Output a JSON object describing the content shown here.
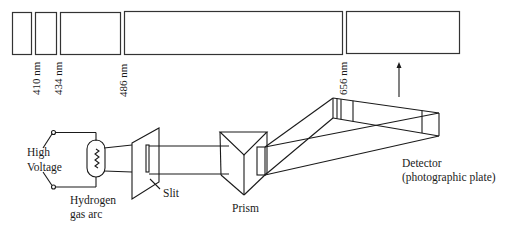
{
  "figure": {
    "type": "hydrogen emission spectrum apparatus",
    "spectrum_lines": [
      {
        "wavelength_label": "410 nm"
      },
      {
        "wavelength_label": "434 nm"
      },
      {
        "wavelength_label": "486 nm"
      },
      {
        "wavelength_label": "656 nm"
      }
    ],
    "components": {
      "voltage_label_line1": "High",
      "voltage_label_line2": "Voltage",
      "source_label_line1": "Hydrogen",
      "source_label_line2": "gas arc",
      "slit_label": "Slit",
      "prism_label": "Prism",
      "detector_label_line1": "Detector",
      "detector_label_line2": "(photographic plate)"
    },
    "colors": {
      "ink": "#1a1a1a",
      "background": "#ffffff"
    }
  }
}
